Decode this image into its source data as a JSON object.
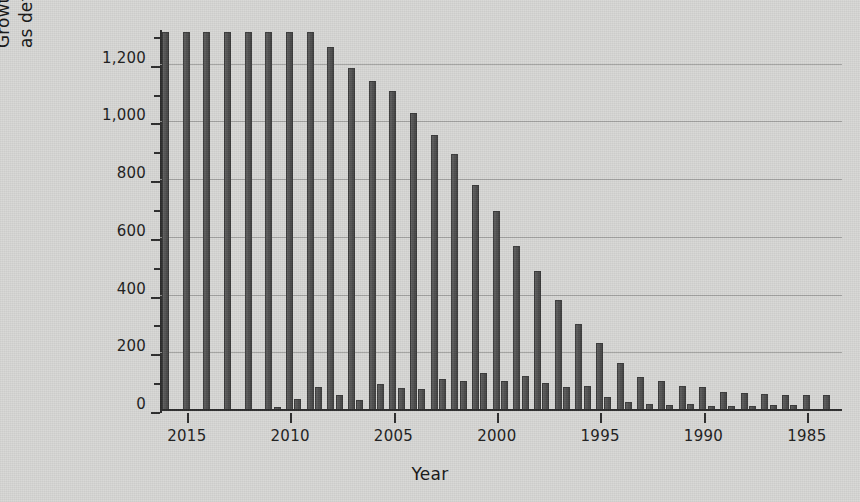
{
  "chart_data": {
    "type": "bar",
    "title": "",
    "xlabel": "Year",
    "ylabel": "Growth of unique folds as defined by CATH v4.0.0",
    "ylabel_lines": [
      "Growth of unique folds",
      "as defined by CATH v4.0.0"
    ],
    "ylim": [
      0,
      1320
    ],
    "yticks": [
      0,
      200,
      400,
      600,
      800,
      1000,
      1200
    ],
    "ytick_labels": [
      "0",
      "200",
      "400",
      "600",
      "800",
      "1,000",
      "1,200"
    ],
    "yminor_ticks": [
      100,
      300,
      500,
      700,
      900,
      1100,
      1300
    ],
    "grid": "horizontal",
    "legend": "none",
    "x_axis_direction": "descending",
    "xticks": [
      2015,
      2010,
      2005,
      2000,
      1995,
      1990,
      1985
    ],
    "xtick_labels": [
      "2015",
      "2010",
      "2005",
      "2000",
      "1995",
      "1990",
      "1985"
    ],
    "x": [
      2016,
      2015,
      2014,
      2013,
      2012,
      2011,
      2010,
      2009,
      2008,
      2007,
      2006,
      2005,
      2004,
      2003,
      2002,
      2001,
      2000,
      1999,
      1998,
      1997,
      1996,
      1995,
      1994,
      1993,
      1992,
      1991,
      1990,
      1989,
      1988,
      1987,
      1986,
      1985,
      1984
    ],
    "series": [
      {
        "name": "Cumulative unique folds",
        "bar_color": "#4c4c4c",
        "clipped_above": 1310,
        "values": [
          1313,
          1313,
          1313,
          1313,
          1313,
          1313,
          1313,
          1313,
          1260,
          1190,
          1143,
          1108,
          1031,
          957,
          890,
          783,
          693,
          573,
          484,
          385,
          300,
          235,
          165,
          118,
          103,
          88,
          82,
          67,
          62,
          58,
          57,
          57,
          57
        ]
      },
      {
        "name": "New folds per year",
        "bar_color": "#4c4c4c",
        "values": [
          0,
          0,
          0,
          0,
          0,
          14,
          41,
          84,
          55,
          38,
          92,
          80,
          76,
          112,
          104,
          133,
          104,
          122,
          96,
          83,
          86,
          50,
          30,
          24,
          22,
          26,
          18,
          16,
          19,
          21,
          20,
          0,
          0
        ]
      }
    ]
  }
}
